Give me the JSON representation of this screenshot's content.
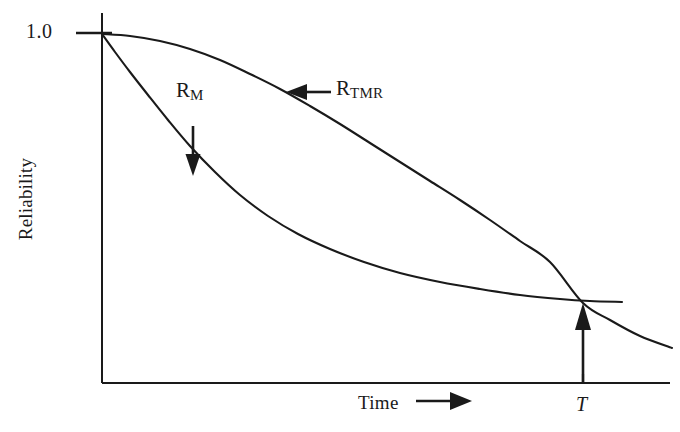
{
  "chart_data": {
    "type": "line",
    "title": "",
    "xlabel": "Time",
    "ylabel": "Reliability",
    "xlabel_arrow": "⟶",
    "grid": false,
    "legend": "inline-annotations",
    "yticks": [
      {
        "label": "1.0",
        "value": 1.0
      }
    ],
    "xticks": [
      {
        "label": "T",
        "value": 0.845,
        "italic": true
      }
    ],
    "xlim": [
      0,
      1
    ],
    "ylim": [
      0,
      1.06
    ],
    "annotations": [
      {
        "name": "R_M",
        "text_main": "R",
        "text_sub": "M",
        "arrow_direction": "down",
        "x": 0.16,
        "y": 0.78
      },
      {
        "name": "R_TMR",
        "text_main": "R",
        "text_sub": "TMR",
        "arrow_direction": "left",
        "x": 0.41,
        "y": 0.86
      },
      {
        "name": "crossover-marker",
        "text_main": "T",
        "text_sub": "",
        "arrow_direction": "up",
        "x": 0.845,
        "y": 0.23
      }
    ],
    "series": [
      {
        "name": "R_TMR",
        "label": "R_TMR",
        "color": "#1a1a1a",
        "points": [
          [
            102,
            34
          ],
          [
            130,
            36
          ],
          [
            160,
            41
          ],
          [
            190,
            49
          ],
          [
            220,
            60
          ],
          [
            250,
            74
          ],
          [
            280,
            89
          ],
          [
            310,
            106
          ],
          [
            340,
            124
          ],
          [
            370,
            143
          ],
          [
            400,
            162
          ],
          [
            430,
            181
          ],
          [
            460,
            200
          ],
          [
            490,
            220
          ],
          [
            520,
            241
          ],
          [
            550,
            262
          ],
          [
            583,
            303
          ],
          [
            610,
            320
          ],
          [
            640,
            336
          ],
          [
            672,
            348
          ]
        ]
      },
      {
        "name": "R_M",
        "label": "R_M",
        "color": "#1a1a1a",
        "points": [
          [
            102,
            34
          ],
          [
            115,
            52
          ],
          [
            130,
            72
          ],
          [
            148,
            95
          ],
          [
            168,
            120
          ],
          [
            190,
            146
          ],
          [
            215,
            172
          ],
          [
            240,
            195
          ],
          [
            268,
            216
          ],
          [
            298,
            234
          ],
          [
            330,
            249
          ],
          [
            364,
            262
          ],
          [
            400,
            273
          ],
          [
            440,
            282
          ],
          [
            480,
            289
          ],
          [
            520,
            295
          ],
          [
            560,
            299
          ],
          [
            590,
            301
          ],
          [
            622,
            302
          ]
        ]
      }
    ],
    "axes": {
      "y_axis": {
        "x": 102,
        "y_top": 13,
        "y_bottom": 383
      },
      "x_axis": {
        "y": 383,
        "x_left": 102,
        "x_right": 670
      },
      "tick_1_0": {
        "y": 33,
        "x_left": 76,
        "x_right": 110
      }
    }
  },
  "labels": {
    "y_axis": "Reliability",
    "x_axis": "Time",
    "x_axis_arrow": "⟶",
    "y_tick_top": "1.0",
    "x_tick_T": "T",
    "curve_rm_main": "R",
    "curve_rm_sub": "M",
    "curve_rtmr_main": "R",
    "curve_rtmr_sub": "TMR"
  },
  "colors": {
    "background": "#ffffff",
    "ink": "#1a1a1a",
    "curve": "#1a1a1a"
  }
}
